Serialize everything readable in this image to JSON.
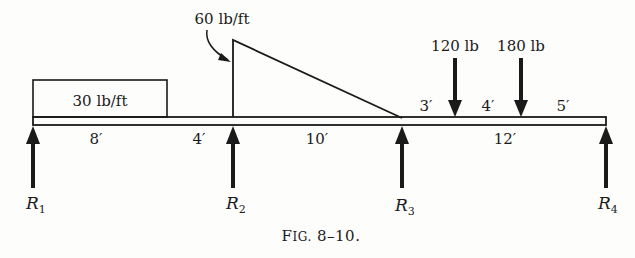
{
  "figure": {
    "caption": "Fig. 8–10.",
    "caption_main": "F",
    "caption_small": "IG.",
    "caption_num": " 8–10."
  },
  "loads": {
    "uniform": {
      "label": "30 lb/ft",
      "value": 30,
      "unit": "lb/ft",
      "span_ft": 8
    },
    "triangular": {
      "label": "60 lb/ft",
      "peak_value": 60,
      "unit": "lb/ft",
      "span_ft": 10
    },
    "point": [
      {
        "label": "120 lb",
        "value": 120,
        "unit": "lb"
      },
      {
        "label": "180 lb",
        "value": 180,
        "unit": "lb"
      }
    ]
  },
  "dimensions": {
    "d8": "8′",
    "d4": "4′",
    "d10": "10′",
    "d12": "12′",
    "d3": "3′",
    "d4b": "4′",
    "d5": "5′"
  },
  "reactions": [
    {
      "base": "R",
      "sub": "1"
    },
    {
      "base": "R",
      "sub": "2"
    },
    {
      "base": "R",
      "sub": "3"
    },
    {
      "base": "R",
      "sub": "4"
    }
  ],
  "colors": {
    "ink": "#1a1a1a",
    "paper": "#fdfdfc"
  }
}
